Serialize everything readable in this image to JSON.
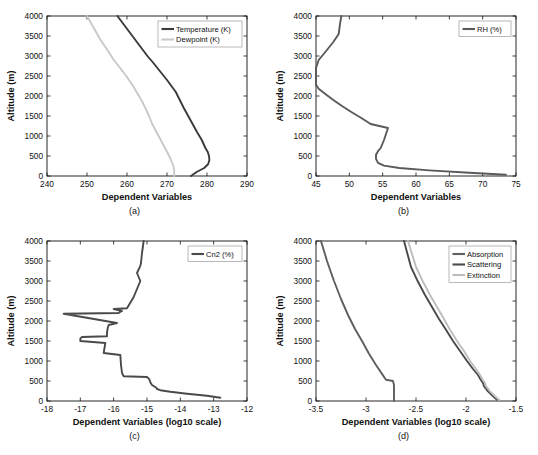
{
  "figure": {
    "title": "",
    "panels": [
      {
        "id": "a",
        "caption": "(a)",
        "xlabel": "Dependent Variables",
        "ylabel": "Altitude (m)",
        "xticks": [
          "240",
          "250",
          "260",
          "270",
          "280",
          "290"
        ],
        "yticks": [
          "0",
          "500",
          "1000",
          "1500",
          "2000",
          "2500",
          "3000",
          "3500",
          "4000"
        ],
        "legend": [
          {
            "label": "Temperature (K)",
            "color": "#3a3a3a"
          },
          {
            "label": "Dewpoint (K)",
            "color": "#c9c9c9"
          }
        ]
      },
      {
        "id": "b",
        "caption": "(b)",
        "xlabel": "Dependent Variables",
        "ylabel": "Altitude (m)",
        "xticks": [
          "45",
          "50",
          "55",
          "60",
          "65",
          "70",
          "75"
        ],
        "yticks": [
          "0",
          "500",
          "1000",
          "1500",
          "2000",
          "2500",
          "3000",
          "3500",
          "4000"
        ],
        "legend": [
          {
            "label": "RH (%)",
            "color": "#5a5a5a"
          }
        ]
      },
      {
        "id": "c",
        "caption": "(c)",
        "xlabel": "Dependent Variables (log10 scale)",
        "ylabel": "Altitude (m)",
        "xticks": [
          "-18",
          "-17",
          "-16",
          "-15",
          "-14",
          "-13",
          "-12"
        ],
        "yticks": [
          "0",
          "500",
          "1000",
          "1500",
          "2000",
          "2500",
          "3000",
          "3500",
          "4000"
        ],
        "legend": [
          {
            "label": "Cn2 (%)",
            "color": "#4a4a4a"
          }
        ]
      },
      {
        "id": "d",
        "caption": "(d)",
        "xlabel": "Dependent Variables (log10 scale)",
        "ylabel": "Altitude (m)",
        "xticks": [
          "-3.5",
          "-3",
          "-2.5",
          "-2",
          "-1.5"
        ],
        "yticks": [
          "0",
          "500",
          "1000",
          "1500",
          "2000",
          "2500",
          "3000",
          "3500",
          "4000"
        ],
        "legend": [
          {
            "label": "Absorption",
            "color": "#5e5e5e"
          },
          {
            "label": "Scattering",
            "color": "#4a4a4a"
          },
          {
            "label": "Extinction",
            "color": "#bdbdbd"
          }
        ]
      }
    ]
  },
  "chart_data": [
    {
      "type": "line",
      "panel": "a",
      "title": "",
      "xlabel": "Dependent Variables",
      "ylabel": "Altitude (m)",
      "xlim": [
        240,
        290
      ],
      "ylim": [
        0,
        4000
      ],
      "xticks": [
        240,
        250,
        260,
        270,
        280,
        290
      ],
      "yticks": [
        0,
        500,
        1000,
        1500,
        2000,
        2500,
        3000,
        3500,
        4000
      ],
      "grid": false,
      "legend_position": "top-right",
      "orientation": "value-on-x, altitude-on-y",
      "series": [
        {
          "name": "Temperature (K)",
          "color": "#3a3a3a",
          "x": [
            276.0,
            277.4,
            279.3,
            280.3,
            280.6,
            280.5,
            280.2,
            279.6,
            278.7,
            277.5,
            276.4,
            275.3,
            274.2,
            273.2,
            272.2,
            271.1,
            270.0,
            268.8,
            267.6,
            266.4,
            265.1,
            263.6,
            262.1,
            260.6,
            259.1,
            257.6
          ],
          "y": [
            0,
            100,
            200,
            300,
            400,
            500,
            600,
            700,
            900,
            1100,
            1300,
            1500,
            1700,
            1900,
            2100,
            2250,
            2400,
            2550,
            2700,
            2850,
            3000,
            3200,
            3400,
            3600,
            3800,
            4000
          ]
        },
        {
          "name": "Dewpoint (K)",
          "color": "#c9c9c9",
          "x": [
            271.8,
            271.8,
            271.6,
            271.0,
            270.3,
            269.5,
            268.7,
            267.9,
            267.1,
            266.3,
            265.5,
            264.6,
            263.6,
            262.4,
            261.2,
            259.8,
            258.3,
            256.7,
            255.1,
            253.4,
            251.7,
            250.0
          ],
          "y": [
            0,
            150,
            250,
            400,
            550,
            700,
            850,
            1000,
            1150,
            1300,
            1500,
            1700,
            1900,
            2100,
            2300,
            2500,
            2700,
            2900,
            3150,
            3400,
            3700,
            4000
          ]
        }
      ]
    },
    {
      "type": "line",
      "panel": "b",
      "title": "",
      "xlabel": "Dependent Variables",
      "ylabel": "Altitude (m)",
      "xlim": [
        45,
        75
      ],
      "ylim": [
        0,
        4000
      ],
      "xticks": [
        45,
        50,
        55,
        60,
        65,
        70,
        75
      ],
      "yticks": [
        0,
        500,
        1000,
        1500,
        2000,
        2500,
        3000,
        3500,
        4000
      ],
      "grid": false,
      "legend_position": "top-right",
      "series": [
        {
          "name": "RH (%)",
          "color": "#5a5a5a",
          "x": [
            73.5,
            68.0,
            62.0,
            57.5,
            55.2,
            54.3,
            54.0,
            54.0,
            54.3,
            54.7,
            55.2,
            55.8,
            53.2,
            51.8,
            50.3,
            48.9,
            47.6,
            46.4,
            45.4,
            45.0,
            45.0,
            45.4,
            46.4,
            47.6,
            48.4,
            48.6,
            48.8
          ],
          "y": [
            30,
            80,
            140,
            200,
            260,
            330,
            430,
            530,
            620,
            700,
            900,
            1200,
            1300,
            1450,
            1600,
            1750,
            1900,
            2050,
            2180,
            2280,
            2700,
            2900,
            3100,
            3350,
            3550,
            3800,
            4000
          ]
        }
      ]
    },
    {
      "type": "line",
      "panel": "c",
      "title": "",
      "xlabel": "Dependent Variables (log10 scale)",
      "ylabel": "Altitude (m)",
      "xlim": [
        -18,
        -12
      ],
      "ylim": [
        0,
        4000
      ],
      "xticks": [
        -18,
        -17,
        -16,
        -15,
        -14,
        -13,
        -12
      ],
      "yticks": [
        0,
        500,
        1000,
        1500,
        2000,
        2500,
        3000,
        3500,
        4000
      ],
      "grid": false,
      "legend_position": "top-right",
      "series": [
        {
          "name": "Cn2 (%)",
          "color": "#4a4a4a",
          "x": [
            -12.8,
            -13.2,
            -13.8,
            -14.3,
            -14.6,
            -14.7,
            -14.72,
            -14.85,
            -14.9,
            -14.92,
            -14.95,
            -15.0,
            -15.7,
            -15.75,
            -15.78,
            -15.8,
            -16.3,
            -16.28,
            -16.25,
            -17.0,
            -17.0,
            -16.95,
            -16.2,
            -16.2,
            -16.18,
            -16.15,
            -15.9,
            -17.5,
            -15.85,
            -15.8,
            -15.75,
            -15.9,
            -16.0,
            -15.6,
            -15.4,
            -15.35,
            -15.3,
            -15.25,
            -15.2,
            -15.3,
            -15.2,
            -15.18,
            -15.15,
            -15.1
          ],
          "y": [
            80,
            130,
            180,
            230,
            270,
            300,
            330,
            400,
            470,
            520,
            560,
            600,
            620,
            700,
            900,
            1150,
            1200,
            1300,
            1450,
            1500,
            1560,
            1600,
            1620,
            1700,
            1820,
            1900,
            1950,
            2180,
            2200,
            2230,
            2250,
            2280,
            2300,
            2320,
            2600,
            2700,
            2800,
            2900,
            3000,
            3200,
            3380,
            3450,
            3700,
            4000
          ]
        }
      ]
    },
    {
      "type": "line",
      "panel": "d",
      "title": "",
      "xlabel": "Dependent Variables (log10 scale)",
      "ylabel": "Altitude (m)",
      "xlim": [
        -3.5,
        -1.5
      ],
      "ylim": [
        0,
        4000
      ],
      "xticks": [
        -3.5,
        -3,
        -2.5,
        -2,
        -1.5
      ],
      "yticks": [
        0,
        500,
        1000,
        1500,
        2000,
        2500,
        3000,
        3500,
        4000
      ],
      "grid": false,
      "legend_position": "top-right",
      "series": [
        {
          "name": "Absorption",
          "color": "#5e5e5e",
          "x": [
            -2.72,
            -2.72,
            -2.72,
            -2.73,
            -2.8,
            -2.83,
            -2.9,
            -2.97,
            -3.04,
            -3.11,
            -3.18,
            -3.25,
            -3.32,
            -3.39,
            -3.45
          ],
          "y": [
            0,
            200,
            400,
            500,
            530,
            640,
            900,
            1180,
            1500,
            1800,
            2150,
            2550,
            3000,
            3500,
            4000
          ]
        },
        {
          "name": "Scattering",
          "color": "#4a4a4a",
          "x": [
            -1.69,
            -1.73,
            -1.78,
            -1.82,
            -1.83,
            -1.85,
            -1.86,
            -1.88,
            -1.93,
            -1.99,
            -2.06,
            -2.13,
            -2.2,
            -2.27,
            -2.34,
            -2.41,
            -2.48,
            -2.55,
            -2.62
          ],
          "y": [
            30,
            120,
            240,
            370,
            450,
            520,
            560,
            650,
            800,
            1000,
            1250,
            1500,
            1780,
            2050,
            2350,
            2650,
            2980,
            3350,
            4000
          ]
        },
        {
          "name": "Extinction",
          "color": "#bdbdbd",
          "x": [
            -1.67,
            -1.71,
            -1.76,
            -1.8,
            -1.81,
            -1.83,
            -1.84,
            -1.86,
            -1.9,
            -1.96,
            -2.02,
            -2.09,
            -2.16,
            -2.22,
            -2.29,
            -2.36,
            -2.43,
            -2.5,
            -2.58
          ],
          "y": [
            30,
            120,
            240,
            370,
            450,
            520,
            560,
            650,
            800,
            1000,
            1250,
            1500,
            1780,
            2050,
            2350,
            2650,
            2980,
            3350,
            4000
          ]
        }
      ]
    }
  ]
}
